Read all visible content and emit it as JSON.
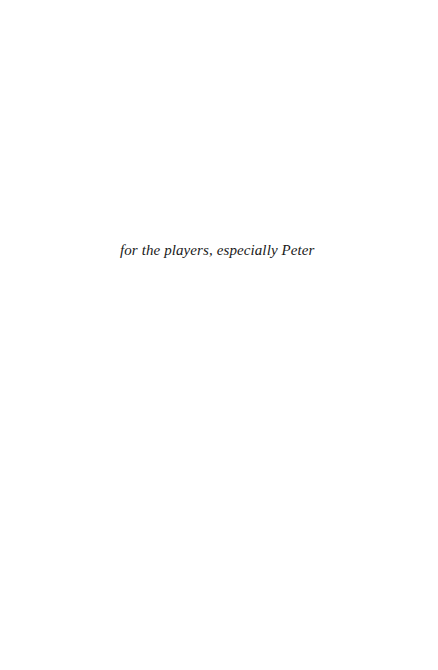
{
  "page": {
    "type": "dedication",
    "text": "for the players, especially Peter"
  }
}
